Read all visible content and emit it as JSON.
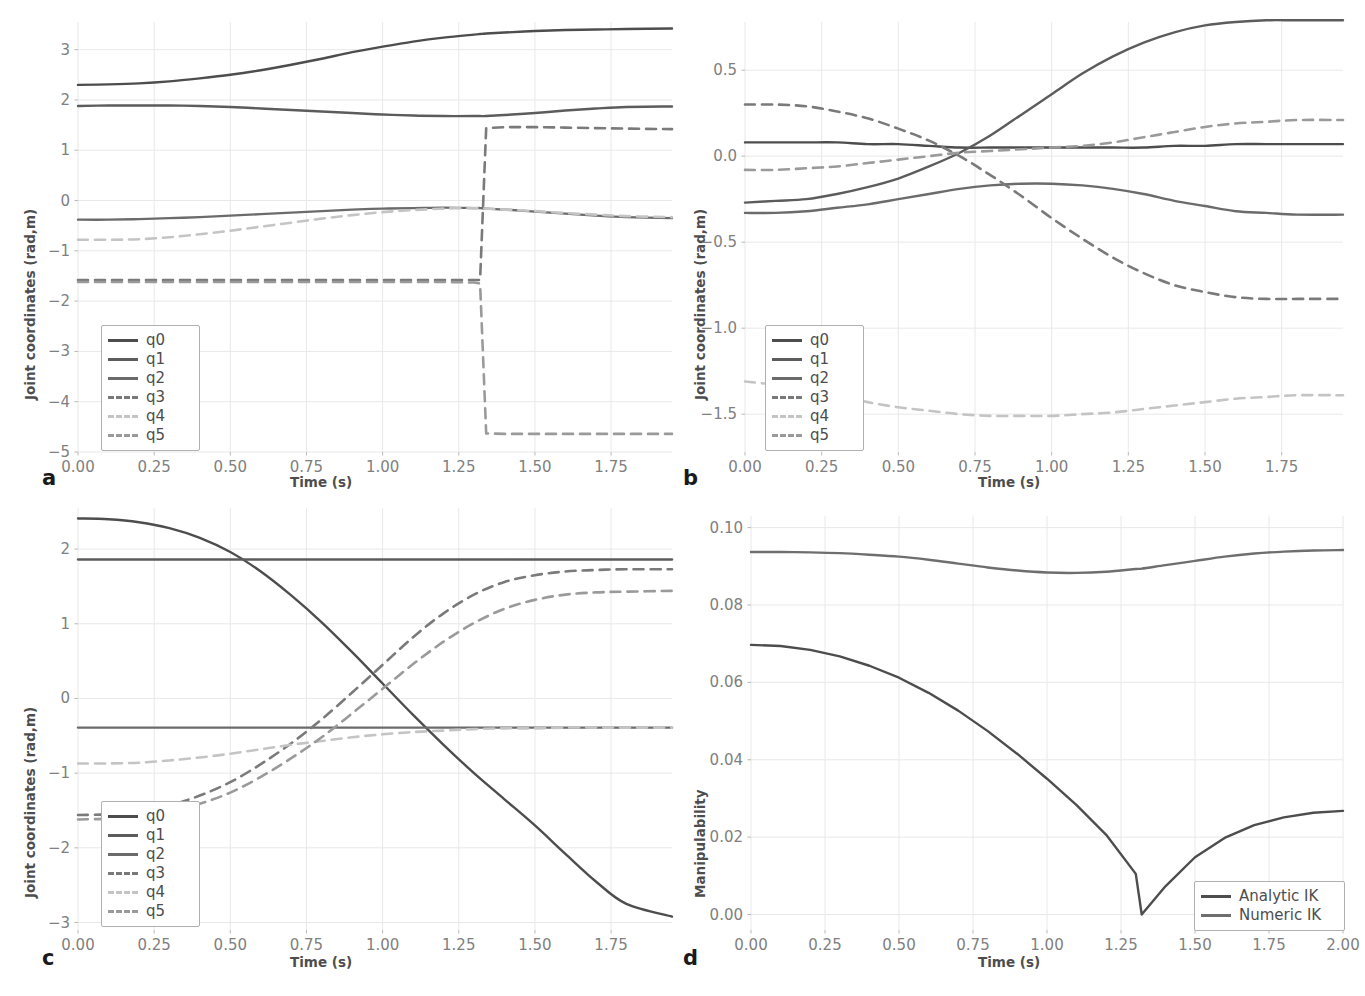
{
  "figure": {
    "background": "#ffffff",
    "panels": [
      "a",
      "b",
      "c",
      "d"
    ]
  },
  "palette": {
    "q0": "#4d4d4d",
    "q1": "#5c5c5c",
    "q2": "#6b6b6b",
    "q3": "#7a7a7a",
    "q4": "#c4c4c4",
    "q5": "#9a9a9a",
    "analytic": "#4d4d4d",
    "numeric": "#6e6e6e",
    "grid": "#e8e8e8",
    "tick_text": "#808080",
    "axis_text": "#4d4d4d"
  },
  "panel_a": {
    "label": "a",
    "xlabel": "Time (s)",
    "ylabel": "Joint coordinates (rad,m)",
    "xticks": [
      "0.00",
      "0.25",
      "0.50",
      "0.75",
      "1.00",
      "1.25",
      "1.50",
      "1.75"
    ],
    "yticks": [
      "3",
      "2",
      "1",
      "0",
      "-1",
      "-2",
      "-3",
      "-4",
      "-5"
    ],
    "legend": [
      {
        "name": "q0",
        "style": "solid"
      },
      {
        "name": "q1",
        "style": "solid"
      },
      {
        "name": "q2",
        "style": "solid"
      },
      {
        "name": "q3",
        "style": "dashed"
      },
      {
        "name": "q4",
        "style": "dashed"
      },
      {
        "name": "q5",
        "style": "dashed"
      }
    ]
  },
  "panel_b": {
    "label": "b",
    "xlabel": "Time (s)",
    "ylabel": "Joint coordinates (rad,m)",
    "xticks": [
      "0.00",
      "0.25",
      "0.50",
      "0.75",
      "1.00",
      "1.25",
      "1.50",
      "1.75"
    ],
    "yticks": [
      "0.5",
      "0.0",
      "-0.5",
      "-1.0",
      "-1.5"
    ],
    "legend": [
      {
        "name": "q0",
        "style": "solid"
      },
      {
        "name": "q1",
        "style": "solid"
      },
      {
        "name": "q2",
        "style": "solid"
      },
      {
        "name": "q3",
        "style": "dashed"
      },
      {
        "name": "q4",
        "style": "dashed"
      },
      {
        "name": "q5",
        "style": "dashed"
      }
    ]
  },
  "panel_c": {
    "label": "c",
    "xlabel": "Time (s)",
    "ylabel": "Joint coordinates (rad,m)",
    "xticks": [
      "0.00",
      "0.25",
      "0.50",
      "0.75",
      "1.00",
      "1.25",
      "1.50",
      "1.75"
    ],
    "yticks": [
      "2",
      "1",
      "0",
      "-1",
      "-2",
      "-3"
    ],
    "legend": [
      {
        "name": "q0",
        "style": "solid"
      },
      {
        "name": "q1",
        "style": "solid"
      },
      {
        "name": "q2",
        "style": "solid"
      },
      {
        "name": "q3",
        "style": "dashed"
      },
      {
        "name": "q4",
        "style": "dashed"
      },
      {
        "name": "q5",
        "style": "dashed"
      }
    ]
  },
  "panel_d": {
    "label": "d",
    "xlabel": "Time (s)",
    "ylabel": "Manipulability",
    "xticks": [
      "0.00",
      "0.25",
      "0.50",
      "0.75",
      "1.00",
      "1.25",
      "1.50",
      "1.75",
      "2.00"
    ],
    "yticks": [
      "0.10",
      "0.08",
      "0.06",
      "0.04",
      "0.02",
      "0.00"
    ],
    "legend": [
      {
        "name": "Analytic IK",
        "style": "solid"
      },
      {
        "name": "Numeric IK",
        "style": "solid"
      }
    ]
  },
  "chart_data": [
    {
      "panel": "a",
      "type": "line",
      "title": "",
      "xlabel": "Time (s)",
      "ylabel": "Joint coordinates (rad,m)",
      "xlim": [
        0.0,
        1.95
      ],
      "ylim": [
        -5.0,
        3.55
      ],
      "grid": true,
      "legend_position": "lower-left",
      "x": [
        0.0,
        0.1,
        0.2,
        0.3,
        0.4,
        0.5,
        0.6,
        0.7,
        0.8,
        0.9,
        1.0,
        1.1,
        1.2,
        1.3,
        1.32,
        1.34,
        1.4,
        1.5,
        1.6,
        1.7,
        1.8,
        1.95
      ],
      "series": [
        {
          "name": "q0",
          "style": "solid",
          "values": [
            2.3,
            2.31,
            2.33,
            2.37,
            2.43,
            2.5,
            2.59,
            2.7,
            2.82,
            2.95,
            3.06,
            3.16,
            3.24,
            3.3,
            3.31,
            3.32,
            3.34,
            3.37,
            3.39,
            3.4,
            3.41,
            3.42
          ]
        },
        {
          "name": "q1",
          "style": "solid",
          "values": [
            1.88,
            1.89,
            1.89,
            1.89,
            1.88,
            1.86,
            1.83,
            1.8,
            1.77,
            1.74,
            1.71,
            1.69,
            1.68,
            1.68,
            1.68,
            1.68,
            1.7,
            1.74,
            1.79,
            1.83,
            1.86,
            1.87
          ]
        },
        {
          "name": "q2",
          "style": "solid",
          "values": [
            -0.38,
            -0.38,
            -0.37,
            -0.35,
            -0.33,
            -0.3,
            -0.27,
            -0.24,
            -0.21,
            -0.18,
            -0.16,
            -0.15,
            -0.14,
            -0.15,
            -0.15,
            -0.16,
            -0.18,
            -0.22,
            -0.26,
            -0.3,
            -0.33,
            -0.35
          ]
        },
        {
          "name": "q3",
          "style": "dashed",
          "values": [
            -1.58,
            -1.58,
            -1.58,
            -1.58,
            -1.58,
            -1.58,
            -1.58,
            -1.58,
            -1.58,
            -1.58,
            -1.58,
            -1.58,
            -1.58,
            -1.58,
            -1.58,
            1.44,
            1.46,
            1.46,
            1.45,
            1.44,
            1.43,
            1.42
          ]
        },
        {
          "name": "q4",
          "style": "dashed",
          "values": [
            -0.78,
            -0.78,
            -0.77,
            -0.73,
            -0.67,
            -0.6,
            -0.52,
            -0.44,
            -0.36,
            -0.29,
            -0.23,
            -0.19,
            -0.16,
            -0.15,
            -0.15,
            -0.16,
            -0.18,
            -0.21,
            -0.25,
            -0.28,
            -0.31,
            -0.33
          ]
        },
        {
          "name": "q5",
          "style": "dashed",
          "values": [
            -1.62,
            -1.62,
            -1.62,
            -1.62,
            -1.62,
            -1.62,
            -1.62,
            -1.62,
            -1.62,
            -1.62,
            -1.62,
            -1.62,
            -1.62,
            -1.63,
            -1.65,
            -4.63,
            -4.64,
            -4.64,
            -4.64,
            -4.64,
            -4.64,
            -4.64
          ]
        }
      ]
    },
    {
      "panel": "b",
      "type": "line",
      "title": "",
      "xlabel": "Time (s)",
      "ylabel": "Joint coordinates (rad,m)",
      "xlim": [
        0.0,
        1.95
      ],
      "ylim": [
        -1.72,
        0.78
      ],
      "grid": true,
      "legend_position": "lower-left",
      "x": [
        0.0,
        0.1,
        0.2,
        0.3,
        0.4,
        0.5,
        0.6,
        0.7,
        0.8,
        0.9,
        1.0,
        1.1,
        1.2,
        1.3,
        1.4,
        1.5,
        1.6,
        1.7,
        1.8,
        1.95
      ],
      "series": [
        {
          "name": "q0",
          "style": "solid",
          "values": [
            0.08,
            0.08,
            0.08,
            0.08,
            0.07,
            0.07,
            0.06,
            0.05,
            0.05,
            0.05,
            0.05,
            0.05,
            0.05,
            0.05,
            0.06,
            0.06,
            0.07,
            0.07,
            0.07,
            0.07
          ]
        },
        {
          "name": "q1",
          "style": "solid",
          "values": [
            -0.27,
            -0.26,
            -0.25,
            -0.22,
            -0.18,
            -0.13,
            -0.06,
            0.02,
            0.12,
            0.24,
            0.36,
            0.48,
            0.58,
            0.66,
            0.72,
            0.76,
            0.78,
            0.79,
            0.79,
            0.79
          ]
        },
        {
          "name": "q2",
          "style": "solid",
          "values": [
            -0.33,
            -0.33,
            -0.32,
            -0.3,
            -0.28,
            -0.25,
            -0.22,
            -0.19,
            -0.17,
            -0.16,
            -0.16,
            -0.17,
            -0.19,
            -0.22,
            -0.26,
            -0.29,
            -0.32,
            -0.33,
            -0.34,
            -0.34
          ]
        },
        {
          "name": "q3",
          "style": "dashed",
          "values": [
            0.3,
            0.3,
            0.29,
            0.26,
            0.22,
            0.16,
            0.09,
            0.0,
            -0.11,
            -0.23,
            -0.36,
            -0.48,
            -0.59,
            -0.68,
            -0.75,
            -0.79,
            -0.82,
            -0.83,
            -0.83,
            -0.83
          ]
        },
        {
          "name": "q4",
          "style": "dashed",
          "values": [
            -1.31,
            -1.33,
            -1.36,
            -1.39,
            -1.43,
            -1.46,
            -1.48,
            -1.5,
            -1.51,
            -1.51,
            -1.51,
            -1.5,
            -1.49,
            -1.47,
            -1.45,
            -1.43,
            -1.41,
            -1.4,
            -1.39,
            -1.39
          ]
        },
        {
          "name": "q5",
          "style": "dashed",
          "values": [
            -0.08,
            -0.08,
            -0.07,
            -0.06,
            -0.04,
            -0.02,
            0.0,
            0.02,
            0.03,
            0.04,
            0.05,
            0.06,
            0.08,
            0.11,
            0.14,
            0.17,
            0.19,
            0.2,
            0.21,
            0.21
          ]
        }
      ]
    },
    {
      "panel": "c",
      "type": "line",
      "title": "",
      "xlabel": "Time (s)",
      "ylabel": "Joint coordinates (rad,m)",
      "xlim": [
        0.0,
        1.95
      ],
      "ylim": [
        -3.1,
        2.55
      ],
      "grid": true,
      "legend_position": "lower-left",
      "x": [
        0.0,
        0.1,
        0.2,
        0.3,
        0.4,
        0.5,
        0.6,
        0.7,
        0.8,
        0.9,
        1.0,
        1.1,
        1.2,
        1.3,
        1.4,
        1.5,
        1.6,
        1.7,
        1.8,
        1.95
      ],
      "series": [
        {
          "name": "q0",
          "style": "solid",
          "values": [
            2.41,
            2.4,
            2.36,
            2.28,
            2.15,
            1.96,
            1.7,
            1.38,
            1.02,
            0.62,
            0.2,
            -0.22,
            -0.62,
            -1.0,
            -1.35,
            -1.7,
            -2.08,
            -2.45,
            -2.75,
            -2.92
          ]
        },
        {
          "name": "q1",
          "style": "solid",
          "values": [
            1.86,
            1.86,
            1.86,
            1.86,
            1.86,
            1.86,
            1.86,
            1.86,
            1.86,
            1.86,
            1.86,
            1.86,
            1.86,
            1.86,
            1.86,
            1.86,
            1.86,
            1.86,
            1.86,
            1.86
          ]
        },
        {
          "name": "q2",
          "style": "solid",
          "values": [
            -0.39,
            -0.39,
            -0.39,
            -0.39,
            -0.39,
            -0.39,
            -0.39,
            -0.39,
            -0.39,
            -0.39,
            -0.39,
            -0.39,
            -0.39,
            -0.39,
            -0.39,
            -0.39,
            -0.39,
            -0.39,
            -0.39,
            -0.39
          ]
        },
        {
          "name": "q3",
          "style": "dashed",
          "values": [
            -1.56,
            -1.55,
            -1.51,
            -1.43,
            -1.3,
            -1.12,
            -0.88,
            -0.6,
            -0.28,
            0.08,
            0.45,
            0.82,
            1.14,
            1.39,
            1.56,
            1.65,
            1.7,
            1.72,
            1.73,
            1.73
          ]
        },
        {
          "name": "q4",
          "style": "dashed",
          "values": [
            -0.87,
            -0.87,
            -0.86,
            -0.83,
            -0.79,
            -0.74,
            -0.68,
            -0.62,
            -0.57,
            -0.52,
            -0.48,
            -0.45,
            -0.43,
            -0.41,
            -0.4,
            -0.4,
            -0.39,
            -0.39,
            -0.39,
            -0.39
          ]
        },
        {
          "name": "q5",
          "style": "dashed",
          "values": [
            -1.62,
            -1.61,
            -1.58,
            -1.52,
            -1.41,
            -1.26,
            -1.05,
            -0.8,
            -0.52,
            -0.2,
            0.13,
            0.46,
            0.76,
            1.01,
            1.2,
            1.32,
            1.39,
            1.42,
            1.43,
            1.44
          ]
        }
      ]
    },
    {
      "panel": "d",
      "type": "line",
      "title": "",
      "xlabel": "Time (s)",
      "ylabel": "Manipulability",
      "xlim": [
        0.0,
        2.0
      ],
      "ylim": [
        -0.004,
        0.103
      ],
      "grid": true,
      "legend_position": "lower-right",
      "x": [
        0.0,
        0.1,
        0.2,
        0.3,
        0.4,
        0.5,
        0.6,
        0.7,
        0.8,
        0.9,
        1.0,
        1.1,
        1.2,
        1.3,
        1.32,
        1.4,
        1.5,
        1.6,
        1.7,
        1.8,
        1.9,
        2.0
      ],
      "series": [
        {
          "name": "Analytic IK",
          "style": "solid",
          "values": [
            0.0697,
            0.0694,
            0.0684,
            0.0667,
            0.0643,
            0.0612,
            0.0573,
            0.0527,
            0.0474,
            0.0415,
            0.0351,
            0.0283,
            0.0206,
            0.0105,
            0.0,
            0.0073,
            0.0148,
            0.0198,
            0.0231,
            0.0251,
            0.0263,
            0.0268
          ]
        },
        {
          "name": "Numeric IK",
          "style": "solid",
          "values": [
            0.0937,
            0.0937,
            0.0936,
            0.0934,
            0.093,
            0.0925,
            0.0917,
            0.0907,
            0.0897,
            0.0889,
            0.0884,
            0.0883,
            0.0886,
            0.0893,
            0.0894,
            0.0903,
            0.0914,
            0.0925,
            0.0933,
            0.0938,
            0.0941,
            0.0942
          ]
        }
      ]
    }
  ]
}
